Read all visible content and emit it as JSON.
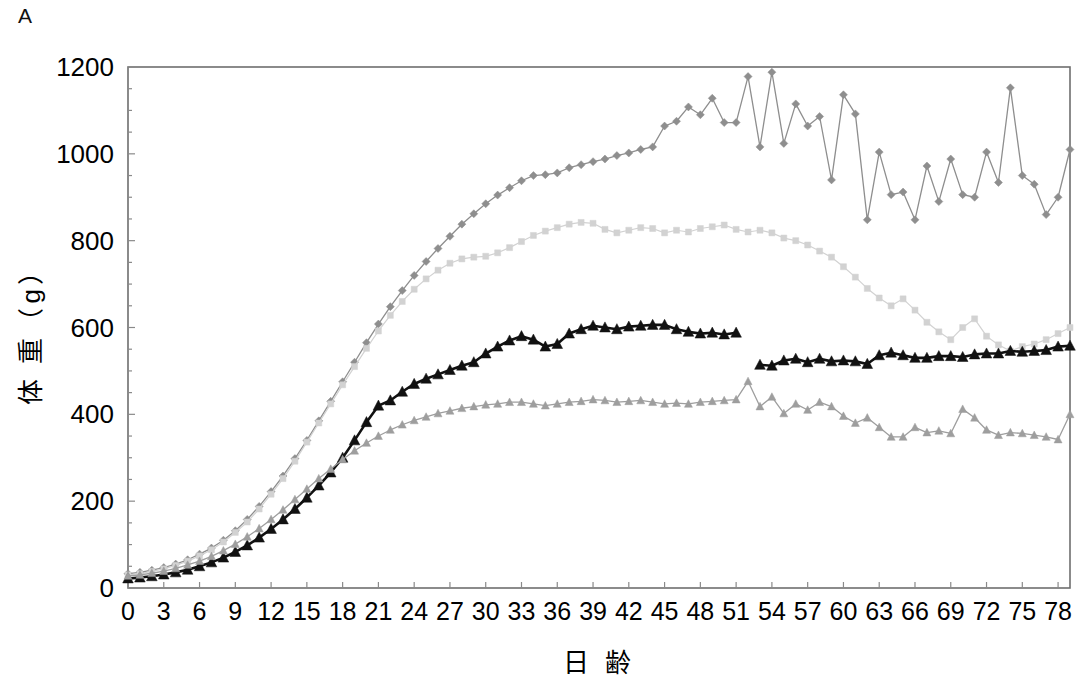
{
  "panel": {
    "label": "A"
  },
  "chart_data": {
    "type": "line",
    "title": "",
    "xlabel": "日 齢",
    "ylabel": "体 重（g）",
    "xlim": [
      0,
      79
    ],
    "ylim": [
      0,
      1200
    ],
    "ytick_labels": [
      "0",
      "200",
      "400",
      "600",
      "800",
      "1000",
      "1200"
    ],
    "ytick_values": [
      0,
      200,
      400,
      600,
      800,
      1000,
      1200
    ],
    "xtick_labels": [
      "0",
      "3",
      "6",
      "9",
      "12",
      "15",
      "18",
      "21",
      "24",
      "27",
      "30",
      "33",
      "36",
      "39",
      "42",
      "45",
      "48",
      "51",
      "54",
      "57",
      "60",
      "63",
      "66",
      "69",
      "72",
      "75",
      "78"
    ],
    "xtick_values": [
      0,
      3,
      6,
      9,
      12,
      15,
      18,
      21,
      24,
      27,
      30,
      33,
      36,
      39,
      42,
      45,
      48,
      51,
      54,
      57,
      60,
      63,
      66,
      69,
      72,
      75,
      78
    ],
    "grid": false,
    "legend": "none",
    "series": [
      {
        "name": "series-top-dark-gray",
        "color": "#8e8e8e",
        "marker": "diamond",
        "marker_size": 4.0,
        "line_width": 1.3,
        "x": [
          0,
          1,
          2,
          3,
          4,
          5,
          6,
          7,
          8,
          9,
          10,
          11,
          12,
          13,
          14,
          15,
          16,
          17,
          18,
          19,
          20,
          21,
          22,
          23,
          24,
          25,
          26,
          27,
          28,
          29,
          30,
          31,
          32,
          33,
          34,
          35,
          36,
          37,
          38,
          39,
          40,
          41,
          42,
          43,
          44,
          45,
          46,
          47,
          48,
          49,
          50,
          51,
          52,
          53,
          54,
          55,
          56,
          57,
          58,
          59,
          60,
          61,
          62,
          63,
          64,
          65,
          66,
          67,
          68,
          69,
          70,
          71,
          72,
          73,
          74,
          75,
          76,
          77,
          78,
          79
        ],
        "y": [
          33,
          36,
          41,
          47,
          55,
          65,
          78,
          92,
          110,
          132,
          158,
          188,
          222,
          258,
          298,
          340,
          385,
          430,
          475,
          520,
          565,
          608,
          648,
          685,
          720,
          752,
          782,
          810,
          838,
          862,
          885,
          905,
          922,
          938,
          950,
          952,
          956,
          968,
          975,
          982,
          988,
          996,
          1002,
          1010,
          1016,
          1064,
          1075,
          1108,
          1090,
          1128,
          1072,
          1072,
          1178,
          1016,
          1188,
          1024,
          1115,
          1064,
          1086,
          940,
          1136,
          1092,
          848,
          1004,
          906,
          912,
          848,
          972,
          890,
          988,
          906,
          900,
          1004,
          934,
          1152,
          950,
          930,
          860,
          900,
          1010
        ]
      },
      {
        "name": "series-light-gray",
        "color": "#d2d2d2",
        "marker": "square",
        "marker_size": 4.0,
        "line_width": 1.2,
        "x": [
          0,
          1,
          2,
          3,
          4,
          5,
          6,
          7,
          8,
          9,
          10,
          11,
          12,
          13,
          14,
          15,
          16,
          17,
          18,
          19,
          20,
          21,
          22,
          23,
          24,
          25,
          26,
          27,
          28,
          29,
          30,
          31,
          32,
          33,
          34,
          35,
          36,
          37,
          38,
          39,
          40,
          41,
          42,
          43,
          44,
          45,
          46,
          47,
          48,
          49,
          50,
          51,
          52,
          53,
          54,
          55,
          56,
          57,
          58,
          59,
          60,
          61,
          62,
          63,
          64,
          65,
          66,
          67,
          68,
          69,
          70,
          71,
          72,
          73,
          74,
          75,
          76,
          77,
          78,
          79
        ],
        "y": [
          30,
          33,
          38,
          44,
          52,
          62,
          74,
          88,
          106,
          128,
          152,
          182,
          216,
          252,
          292,
          336,
          380,
          424,
          468,
          510,
          552,
          592,
          628,
          660,
          688,
          712,
          732,
          748,
          758,
          762,
          764,
          772,
          784,
          798,
          812,
          822,
          830,
          838,
          842,
          840,
          826,
          818,
          824,
          830,
          828,
          818,
          824,
          820,
          828,
          832,
          836,
          826,
          820,
          824,
          818,
          806,
          800,
          790,
          776,
          762,
          740,
          716,
          690,
          668,
          650,
          666,
          640,
          612,
          590,
          572,
          600,
          620,
          580,
          560,
          546,
          556,
          562,
          572,
          586,
          600
        ]
      },
      {
        "name": "series-black-triangle",
        "color": "#111111",
        "marker": "triangle",
        "marker_size": 5.6,
        "line_width": 2.6,
        "x": [
          0,
          1,
          2,
          3,
          4,
          5,
          6,
          7,
          8,
          9,
          10,
          11,
          12,
          13,
          14,
          15,
          16,
          17,
          18,
          19,
          20,
          21,
          22,
          23,
          24,
          25,
          26,
          27,
          28,
          29,
          30,
          31,
          32,
          33,
          34,
          35,
          36,
          37,
          38,
          39,
          40,
          41,
          42,
          43,
          44,
          45,
          46,
          47,
          48,
          49,
          50,
          51,
          52,
          53,
          54,
          55,
          56,
          57,
          58,
          59,
          60,
          61,
          62,
          63,
          64,
          65,
          66,
          67,
          68,
          69,
          70,
          71,
          72,
          73,
          74,
          75,
          76,
          77,
          78,
          79
        ],
        "y": [
          22,
          24,
          27,
          31,
          36,
          42,
          50,
          59,
          70,
          83,
          98,
          116,
          136,
          158,
          182,
          208,
          236,
          266,
          300,
          340,
          382,
          420,
          432,
          452,
          470,
          482,
          492,
          502,
          512,
          520,
          540,
          556,
          570,
          580,
          572,
          556,
          562,
          586,
          596,
          604,
          600,
          596,
          602,
          604,
          606,
          606,
          596,
          590,
          586,
          588,
          584,
          588,
          null,
          514,
          512,
          524,
          528,
          520,
          528,
          522,
          524,
          522,
          516,
          536,
          542,
          536,
          530,
          530,
          534,
          534,
          532,
          538,
          540,
          540,
          546,
          544,
          546,
          548,
          556,
          558
        ]
      },
      {
        "name": "series-bottom-gray",
        "color": "#9e9e9e",
        "marker": "triangle",
        "marker_size": 4.2,
        "line_width": 1.3,
        "x": [
          0,
          1,
          2,
          3,
          4,
          5,
          6,
          7,
          8,
          9,
          10,
          11,
          12,
          13,
          14,
          15,
          16,
          17,
          18,
          19,
          20,
          21,
          22,
          23,
          24,
          25,
          26,
          27,
          28,
          29,
          30,
          31,
          32,
          33,
          34,
          35,
          36,
          37,
          38,
          39,
          40,
          41,
          42,
          43,
          44,
          45,
          46,
          47,
          48,
          49,
          50,
          51,
          52,
          53,
          54,
          55,
          56,
          57,
          58,
          59,
          60,
          61,
          62,
          63,
          64,
          65,
          66,
          67,
          68,
          69,
          70,
          71,
          72,
          73,
          74,
          75,
          76,
          77,
          78,
          79
        ],
        "y": [
          28,
          30,
          34,
          39,
          45,
          53,
          62,
          73,
          86,
          101,
          118,
          137,
          158,
          180,
          204,
          228,
          252,
          274,
          296,
          316,
          334,
          350,
          364,
          376,
          386,
          394,
          402,
          408,
          414,
          418,
          422,
          424,
          428,
          428,
          424,
          420,
          424,
          428,
          430,
          434,
          432,
          428,
          430,
          432,
          428,
          424,
          426,
          424,
          428,
          430,
          432,
          434,
          476,
          418,
          440,
          402,
          424,
          410,
          428,
          418,
          396,
          380,
          392,
          370,
          348,
          348,
          370,
          358,
          362,
          356,
          412,
          392,
          364,
          352,
          358,
          356,
          352,
          348,
          342,
          400
        ]
      }
    ]
  }
}
